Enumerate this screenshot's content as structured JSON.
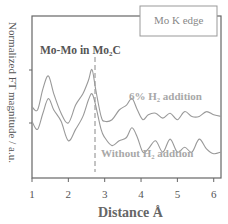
{
  "chart_data": {
    "type": "line",
    "title": "",
    "xlabel": "Distance  Å",
    "ylabel": "Normalized FT magnitude / a.u.",
    "xlim": [
      1,
      6.2
    ],
    "ylim": [
      0,
      1
    ],
    "x_ticks": [
      "1",
      "2",
      "3",
      "4",
      "5",
      "6"
    ],
    "grid": false,
    "legend_box": "Mo K edge",
    "annotations": [
      {
        "text": "Mo-Mo in Mo₂C",
        "x": 2.65,
        "type": "dashed-vertical-line"
      }
    ],
    "series": [
      {
        "name": "6% H₂ addition",
        "x": [
          1.0,
          1.15,
          1.3,
          1.45,
          1.6,
          1.8,
          2.0,
          2.2,
          2.4,
          2.55,
          2.65,
          2.75,
          2.9,
          3.0,
          3.2,
          3.4,
          3.6,
          3.75,
          3.9,
          4.05,
          4.2,
          4.4,
          4.6,
          4.8,
          5.0,
          5.2,
          5.4,
          5.6,
          5.8,
          6.0,
          6.2
        ],
        "values": [
          0.44,
          0.42,
          0.55,
          0.63,
          0.52,
          0.4,
          0.34,
          0.45,
          0.52,
          0.6,
          0.67,
          0.55,
          0.38,
          0.35,
          0.36,
          0.42,
          0.45,
          0.49,
          0.42,
          0.36,
          0.39,
          0.4,
          0.37,
          0.4,
          0.36,
          0.41,
          0.38,
          0.38,
          0.41,
          0.39,
          0.38
        ]
      },
      {
        "name": "Without H₂ addtion",
        "x": [
          1.0,
          1.15,
          1.3,
          1.45,
          1.6,
          1.8,
          2.0,
          2.2,
          2.4,
          2.55,
          2.65,
          2.75,
          2.9,
          3.0,
          3.2,
          3.4,
          3.6,
          3.75,
          3.9,
          4.05,
          4.2,
          4.4,
          4.6,
          4.8,
          5.0,
          5.2,
          5.4,
          5.6,
          5.8,
          6.0,
          6.2
        ],
        "values": [
          0.35,
          0.3,
          0.4,
          0.49,
          0.42,
          0.35,
          0.23,
          0.3,
          0.38,
          0.48,
          0.52,
          0.45,
          0.3,
          0.25,
          0.2,
          0.23,
          0.25,
          0.31,
          0.25,
          0.16,
          0.18,
          0.23,
          0.16,
          0.24,
          0.16,
          0.19,
          0.16,
          0.24,
          0.18,
          0.15,
          0.16
        ]
      }
    ]
  },
  "labels": {
    "ylabel": "Normalized FT magnitude / a.u.",
    "xlabel": "Distance  Å",
    "legend_box": "Mo K edge",
    "annotation": "Mo-Mo in Mo₂C",
    "series_top": "6% H₂ addition",
    "series_bottom": "Without H₂ addtion",
    "ticks": [
      "1",
      "2",
      "3",
      "4",
      "5",
      "6"
    ]
  }
}
